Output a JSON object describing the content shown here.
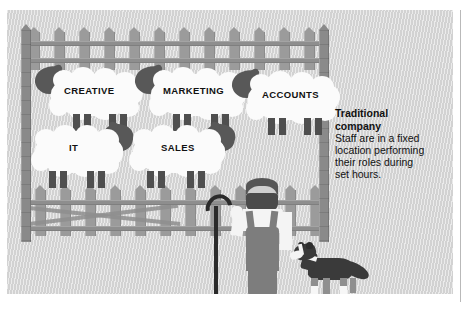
{
  "illustration": {
    "title": "Traditional company",
    "alt_description": "Sheep penned behind a fence, each labelled with a department, watched by a shepherd and a sheepdog",
    "background_color": "#d2d2d2",
    "fence_color": "#9b9b9b",
    "post_color": "#8a8a8a",
    "sheep_body_color": "#fbfbfb",
    "sheep_head_color": "#585858",
    "ink_color": "#111111"
  },
  "pen": {
    "sheep": [
      {
        "label": "CREATIVE",
        "row": 1,
        "order": 1
      },
      {
        "label": "MARKETING",
        "row": 1,
        "order": 2
      },
      {
        "label": "ACCOUNTS",
        "row": 1,
        "order": 3
      },
      {
        "label": "IT",
        "row": 2,
        "order": 1
      },
      {
        "label": "SALES",
        "row": 2,
        "order": 2
      }
    ]
  },
  "figures": {
    "shepherd": "shepherd-figure",
    "shepherd_crook": "shepherd-crook",
    "sheepdog": "sheepdog-figure"
  },
  "caption": {
    "heading_line1": "Traditional",
    "heading_line2": "company",
    "body_line1": "Staff are in a fixed",
    "body_line2": "location performing",
    "body_line3": "their roles during",
    "body_line4": "set hours."
  }
}
